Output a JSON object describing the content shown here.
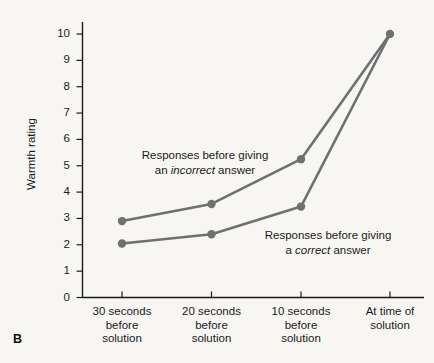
{
  "figure": {
    "panel_label": "B",
    "background_color": "#f7f6f3",
    "series_color": "#6f7072",
    "axis_color": "#1a1a1a"
  },
  "chart_data": {
    "type": "line",
    "title": "",
    "xlabel": "",
    "ylabel": "Warmth rating",
    "ylim": [
      0,
      10.6
    ],
    "yticks": [
      0,
      1,
      2,
      3,
      4,
      5,
      6,
      7,
      8,
      9,
      10
    ],
    "ytick_labels": [
      "0",
      "1",
      "2",
      "3",
      "4",
      "5",
      "6",
      "7",
      "8",
      "9",
      "10"
    ],
    "grid": false,
    "legend_position": "inline-annotations",
    "categories": [
      "30 seconds before solution",
      "20 seconds before solution",
      "10 seconds before solution",
      "At time of solution"
    ],
    "xtick_labels": [
      [
        "30 seconds",
        "before",
        "solution"
      ],
      [
        "20 seconds",
        "before",
        "solution"
      ],
      [
        "10 seconds",
        "before",
        "solution"
      ],
      [
        "At time of",
        "solution"
      ]
    ],
    "series": [
      {
        "name": "Responses before giving an incorrect answer",
        "values": [
          2.9,
          3.55,
          5.25,
          10.0
        ]
      },
      {
        "name": "Responses before giving a correct answer",
        "values": [
          2.05,
          2.4,
          3.45,
          10.0
        ]
      }
    ]
  },
  "annotations": {
    "incorrect": {
      "line1": "Responses before giving",
      "line2_prefix": "an ",
      "line2_italic": "incorrect",
      "line2_suffix": " answer"
    },
    "correct": {
      "line1": "Responses before giving",
      "line2_prefix": "a ",
      "line2_italic": "correct",
      "line2_suffix": " answer"
    }
  }
}
